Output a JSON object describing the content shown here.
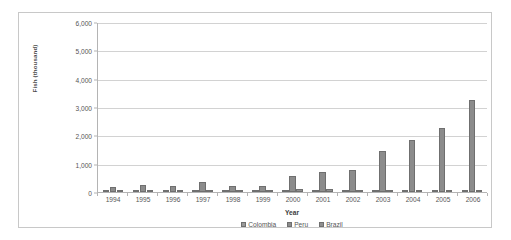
{
  "chart_data": {
    "type": "bar",
    "title": "",
    "xlabel": "Year",
    "ylabel": "Fish (thousand)",
    "ylim": [
      0,
      6000
    ],
    "yticks": [
      "0",
      "1,000",
      "2,000",
      "3,000",
      "4,000",
      "5,000",
      "6,000"
    ],
    "ytick_values": [
      0,
      1000,
      2000,
      3000,
      4000,
      5000,
      6000
    ],
    "grid": true,
    "legend_position": "bottom",
    "categories": [
      "1994",
      "1995",
      "1996",
      "1997",
      "1998",
      "1999",
      "2000",
      "2001",
      "2002",
      "2003",
      "2004",
      "2005",
      "2006"
    ],
    "series": [
      {
        "name": "Colombia",
        "color": "#9a9a9a",
        "values": [
          40,
          45,
          40,
          50,
          40,
          45,
          50,
          45,
          45,
          50,
          50,
          45,
          45
        ]
      },
      {
        "name": "Peru",
        "color": "#8c8c8c",
        "values": [
          170,
          230,
          200,
          370,
          210,
          225,
          580,
          720,
          760,
          1430,
          1830,
          2270,
          3230
        ]
      },
      {
        "name": "Brazil",
        "color": "#8f8f8f",
        "values": [
          30,
          35,
          30,
          40,
          35,
          40,
          120,
          95,
          80,
          80,
          75,
          70,
          85
        ]
      }
    ]
  },
  "legend": {
    "items": [
      {
        "label": "Colombia"
      },
      {
        "label": "Peru"
      },
      {
        "label": "Brazil"
      }
    ]
  },
  "axes": {
    "x_title": "Year",
    "y_title": "Fish (thousand)"
  }
}
